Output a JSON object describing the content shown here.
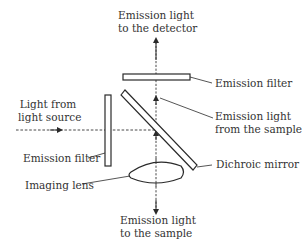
{
  "diagram": {
    "type": "optical-path-schematic",
    "labels": {
      "top": [
        "Emission light",
        "to the detector"
      ],
      "emission_filter_top": "Emission filter",
      "light_source": [
        "Light from",
        "light source"
      ],
      "emission_from_sample": [
        "Emission light",
        "from the sample"
      ],
      "emission_filter_left": "Emission filter",
      "dichroic_mirror": "Dichroic mirror",
      "imaging_lens": "Imaging lens",
      "bottom": [
        "Emission light",
        "to the sample"
      ]
    },
    "colors": {
      "line": "#2a2a2a",
      "background": "#ffffff"
    }
  }
}
